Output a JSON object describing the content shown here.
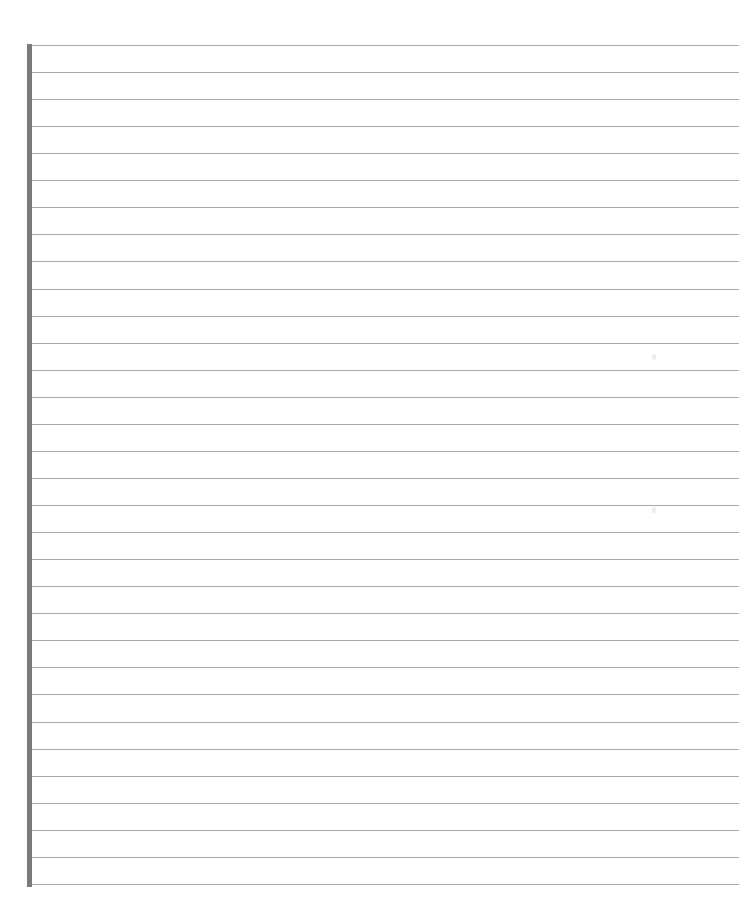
{
  "document": {
    "type": "lined-paper",
    "line_count": 32,
    "line_spacing_px": 27,
    "first_line_y": 45,
    "colors": {
      "paper": "#ffffff",
      "rule": "#a8a8a8",
      "margin_bar": "#7a7a7a"
    },
    "text_content": ""
  }
}
